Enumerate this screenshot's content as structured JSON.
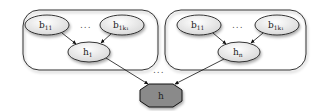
{
  "diagram": {
    "type": "hierarchical-graph",
    "groups": [
      {
        "id": "group-1",
        "leaves": [
          {
            "base": "b",
            "sub": "11"
          },
          {
            "base": "b",
            "sub": "1k₁"
          }
        ],
        "leaf_ellipsis": "...",
        "hidden": {
          "base": "h",
          "sub": "1"
        }
      },
      {
        "id": "group-n",
        "leaves": [
          {
            "base": "b",
            "sub": "11"
          },
          {
            "base": "b",
            "sub": "1k₁"
          }
        ],
        "leaf_ellipsis": "...",
        "hidden": {
          "base": "h",
          "sub": "n"
        }
      }
    ],
    "group_ellipsis": "...",
    "root": {
      "label": "h"
    },
    "colors": {
      "leaf_fill": "#e6e6e6",
      "root_fill": "#8a8a8a",
      "stroke": "#222222",
      "container_stroke": "#333333"
    }
  }
}
